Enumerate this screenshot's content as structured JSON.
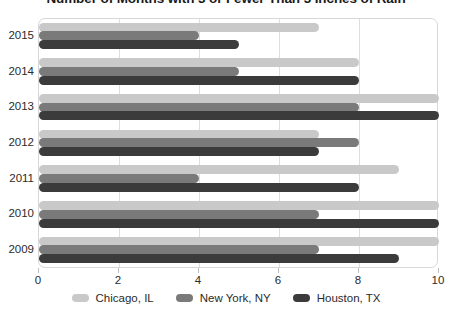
{
  "chart_data": {
    "type": "bar",
    "orientation": "horizontal",
    "title": "Number of Months with 3 or Fewer Than 3 Inches of Rain",
    "xlabel": "",
    "ylabel": "",
    "categories": [
      "2015",
      "2014",
      "2013",
      "2012",
      "2011",
      "2010",
      "2009"
    ],
    "series": [
      {
        "name": "Chicago, IL",
        "color": "#c9c9c9",
        "values": [
          7,
          8,
          10,
          7,
          9,
          10,
          10
        ]
      },
      {
        "name": "New York, NY",
        "color": "#7a7a7a",
        "values": [
          4,
          5,
          8,
          8,
          4,
          7,
          7
        ]
      },
      {
        "name": "Houston, TX",
        "color": "#3b3b3b",
        "values": [
          5,
          8,
          10,
          7,
          8,
          10,
          9
        ]
      }
    ],
    "xlim": [
      0,
      10
    ],
    "xticks": [
      0,
      2,
      4,
      6,
      8,
      10
    ],
    "xtick_labels": [
      "0",
      "2",
      "4",
      "6",
      "8",
      "10"
    ],
    "grid": true,
    "grid_axis": "x",
    "legend_position": "bottom",
    "plot_border_color": "#d7d7d7",
    "gridline_color": "#dedede"
  }
}
